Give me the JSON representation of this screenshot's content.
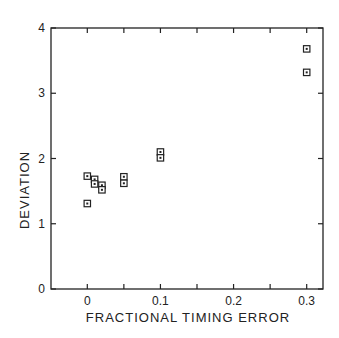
{
  "chart_data": {
    "type": "scatter",
    "title": "",
    "xlabel": "FRACTIONAL TIMING ERROR",
    "ylabel": "DEVIATION",
    "xlim": [
      -0.05,
      0.325
    ],
    "ylim": [
      0,
      4
    ],
    "x_ticks": [
      0,
      0.1,
      0.2,
      0.3
    ],
    "x_tick_labels": [
      "0",
      "0.1",
      "0.2",
      "0.3"
    ],
    "x_minor_ticks": [
      0.05,
      0.15,
      0.25
    ],
    "y_ticks": [
      0,
      1,
      2,
      3,
      4
    ],
    "y_tick_labels": [
      "0",
      "1",
      "2",
      "3",
      "4"
    ],
    "grid": false,
    "legend": null,
    "marker": "open-square",
    "series": [
      {
        "name": "data",
        "points": [
          {
            "x": 0.0,
            "y": 1.73
          },
          {
            "x": 0.0,
            "y": 1.31
          },
          {
            "x": 0.01,
            "y": 1.68
          },
          {
            "x": 0.01,
            "y": 1.61
          },
          {
            "x": 0.02,
            "y": 1.59
          },
          {
            "x": 0.02,
            "y": 1.52
          },
          {
            "x": 0.05,
            "y": 1.72
          },
          {
            "x": 0.05,
            "y": 1.62
          },
          {
            "x": 0.1,
            "y": 2.1
          },
          {
            "x": 0.1,
            "y": 2.01
          },
          {
            "x": 0.3,
            "y": 3.68
          },
          {
            "x": 0.3,
            "y": 3.32
          }
        ]
      }
    ]
  },
  "colors": {
    "ink": "#222222",
    "background": "#ffffff"
  }
}
